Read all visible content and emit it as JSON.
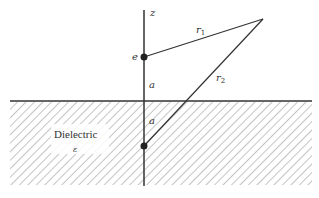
{
  "diagram": {
    "type": "image-charge-dielectric",
    "colors": {
      "line": "#333333",
      "hatch": "#888888",
      "background": "#ffffff"
    },
    "labels": {
      "axis": "z",
      "charge": "e",
      "r1": "r",
      "r1_sub": "1",
      "r2": "r",
      "r2_sub": "2",
      "dist_above": "a",
      "dist_below": "a",
      "region": "Dielectric",
      "permittivity": "ε"
    },
    "geometry": {
      "axis_x": 144,
      "axis_top": 10,
      "axis_bottom": 186,
      "charge": [
        144,
        57
      ],
      "image_charge": [
        144,
        146
      ],
      "field_point": [
        263,
        19
      ],
      "surface_y": 101,
      "surface_x": [
        10,
        312
      ],
      "hatch_region": {
        "x": 10,
        "y": 101,
        "w": 302,
        "h": 84
      }
    }
  }
}
